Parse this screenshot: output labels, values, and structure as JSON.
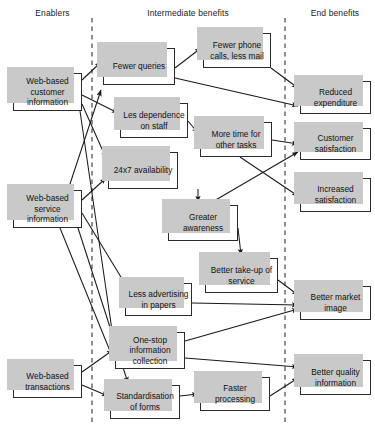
{
  "diagram": {
    "columns": [
      {
        "id": "enablers",
        "label": "Enablers"
      },
      {
        "id": "intermediate",
        "label": "Intermediate benefits"
      },
      {
        "id": "end",
        "label": "End benefits"
      }
    ],
    "nodes": [
      {
        "id": "web-customer-info",
        "label": "Web-based customer information",
        "column": "enablers",
        "x": 13,
        "y": 73,
        "w": 69,
        "h": 38
      },
      {
        "id": "web-service-info",
        "label": "Web-based service information",
        "column": "enablers",
        "x": 13,
        "y": 190,
        "w": 69,
        "h": 38
      },
      {
        "id": "web-transactions",
        "label": "Web-based transactions",
        "column": "enablers",
        "x": 13,
        "y": 365,
        "w": 69,
        "h": 33
      },
      {
        "id": "fewer-queries",
        "label": "Fewer queries",
        "column": "intermediate",
        "x": 103,
        "y": 48,
        "w": 72,
        "h": 37
      },
      {
        "id": "fewer-phone-calls",
        "label": "Fewer phone calls, less mail",
        "column": "intermediate",
        "x": 203,
        "y": 33,
        "w": 68,
        "h": 35
      },
      {
        "id": "less-dependence",
        "label": "Les dependence on staff",
        "column": "intermediate",
        "x": 120,
        "y": 103,
        "w": 68,
        "h": 35
      },
      {
        "id": "availability-24x7",
        "label": "24x7 availability",
        "column": "intermediate",
        "x": 108,
        "y": 152,
        "w": 70,
        "h": 37
      },
      {
        "id": "more-time",
        "label": "More time for other tasks",
        "column": "intermediate",
        "x": 200,
        "y": 122,
        "w": 72,
        "h": 35
      },
      {
        "id": "greater-awareness",
        "label": "Greater awareness",
        "column": "intermediate",
        "x": 168,
        "y": 205,
        "w": 70,
        "h": 36
      },
      {
        "id": "better-take-up",
        "label": "Better take-up of service",
        "column": "intermediate",
        "x": 205,
        "y": 258,
        "w": 73,
        "h": 35
      },
      {
        "id": "less-advertising",
        "label": "Less advertising in papers",
        "column": "intermediate",
        "x": 125,
        "y": 283,
        "w": 67,
        "h": 33
      },
      {
        "id": "one-stop",
        "label": "One-stop information collection",
        "column": "intermediate",
        "x": 115,
        "y": 332,
        "w": 70,
        "h": 37
      },
      {
        "id": "standardisation",
        "label": "Standardisation of forms",
        "column": "intermediate",
        "x": 110,
        "y": 385,
        "w": 70,
        "h": 34
      },
      {
        "id": "faster-processing",
        "label": "Faster processing",
        "column": "intermediate",
        "x": 200,
        "y": 377,
        "w": 70,
        "h": 34
      },
      {
        "id": "reduced-expenditure",
        "label": "Reduced expenditure",
        "column": "end",
        "x": 300,
        "y": 81,
        "w": 71,
        "h": 33
      },
      {
        "id": "customer-satisfaction",
        "label": "Customer satisfaction",
        "column": "end",
        "x": 300,
        "y": 128,
        "w": 71,
        "h": 32
      },
      {
        "id": "increased-satisfaction",
        "label": "Increased satisfaction",
        "column": "end",
        "x": 300,
        "y": 178,
        "w": 71,
        "h": 34
      },
      {
        "id": "better-market-image",
        "label": "Better market image",
        "column": "end",
        "x": 300,
        "y": 286,
        "w": 71,
        "h": 34
      },
      {
        "id": "better-quality-info",
        "label": "Better quality information",
        "column": "end",
        "x": 300,
        "y": 360,
        "w": 71,
        "h": 35
      }
    ],
    "dividers": [
      {
        "id": "divider-left",
        "x": 92,
        "y1": 18,
        "y2": 425
      },
      {
        "id": "divider-right",
        "x": 285,
        "y1": 18,
        "y2": 425
      }
    ],
    "edges": [
      {
        "from": "web-customer-info",
        "to": "fewer-queries"
      },
      {
        "from": "web-customer-info",
        "to": "less-dependence"
      },
      {
        "from": "web-customer-info",
        "to": "availability-24x7"
      },
      {
        "from": "web-customer-info",
        "to": "one-stop"
      },
      {
        "from": "web-service-info",
        "to": "fewer-queries"
      },
      {
        "from": "web-service-info",
        "to": "availability-24x7"
      },
      {
        "from": "web-service-info",
        "to": "less-advertising"
      },
      {
        "from": "web-service-info",
        "to": "one-stop"
      },
      {
        "from": "web-service-info",
        "to": "standardisation"
      },
      {
        "from": "web-transactions",
        "to": "one-stop"
      },
      {
        "from": "web-transactions",
        "to": "standardisation"
      },
      {
        "from": "fewer-queries",
        "to": "fewer-phone-calls"
      },
      {
        "from": "fewer-queries",
        "to": "reduced-expenditure"
      },
      {
        "from": "fewer-phone-calls",
        "to": "reduced-expenditure"
      },
      {
        "from": "less-dependence",
        "to": "more-time"
      },
      {
        "from": "availability-24x7",
        "to": "greater-awareness"
      },
      {
        "from": "more-time",
        "to": "customer-satisfaction"
      },
      {
        "from": "more-time",
        "to": "increased-satisfaction"
      },
      {
        "from": "greater-awareness",
        "to": "customer-satisfaction"
      },
      {
        "from": "greater-awareness",
        "to": "better-take-up"
      },
      {
        "from": "better-take-up",
        "to": "better-market-image"
      },
      {
        "from": "less-advertising",
        "to": "better-market-image"
      },
      {
        "from": "one-stop",
        "to": "better-market-image"
      },
      {
        "from": "one-stop",
        "to": "better-quality-info"
      },
      {
        "from": "standardisation",
        "to": "faster-processing"
      },
      {
        "from": "faster-processing",
        "to": "better-quality-info"
      }
    ],
    "colors": {
      "box_border": "#2b2b2b",
      "box_fill": "#ffffff",
      "shadow": "#c9c9c9",
      "line": "#1a1a1a",
      "divider": "#333333",
      "text": "#111111",
      "background": "#ffffff"
    }
  }
}
